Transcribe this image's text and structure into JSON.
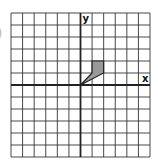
{
  "left_fragment": ")",
  "grid": {
    "columns": 12,
    "rows": 12,
    "origin_col": 6,
    "origin_row": 6,
    "line_color": "#333333",
    "axis_color": "#222222"
  },
  "axes": {
    "x_label": "x",
    "y_label": "y"
  },
  "shape": {
    "vertices": [
      [
        0,
        0
      ],
      [
        1,
        1
      ],
      [
        1,
        2
      ],
      [
        2,
        2
      ],
      [
        2,
        1
      ]
    ],
    "fill": "#999999",
    "stroke": "#222222"
  }
}
